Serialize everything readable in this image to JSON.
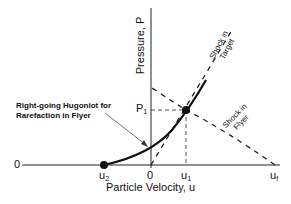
{
  "diagram": {
    "title": "",
    "axes": {
      "x_label": "Particle Velocity, u",
      "y_label": "Pressure, P",
      "x_origin_label": "0",
      "left_zero_label": "0"
    },
    "ticks": {
      "u2": {
        "base": "u",
        "sub": "2"
      },
      "u1": {
        "base": "u",
        "sub": "1"
      },
      "uf": {
        "base": "u",
        "sub": "f"
      },
      "p1": {
        "base": "P",
        "sub": "1"
      }
    },
    "annotations": {
      "hugoniot_line1": "Right-going Hugoniot for",
      "hugoniot_line2": "Rarefaction in Flyer",
      "shock_target_line1": "Shock in",
      "shock_target_line2": "Target",
      "shock_flyer_line1": "Shock in",
      "shock_flyer_line2": "Flyer"
    },
    "curves": [
      {
        "name": "Right-going Hugoniot for Rarefaction in Flyer",
        "style": "solid"
      },
      {
        "name": "Shock in Target",
        "style": "dashed"
      },
      {
        "name": "Shock in Flyer",
        "style": "dashed"
      },
      {
        "name": "P1 level",
        "style": "dashed"
      },
      {
        "name": "u1 level",
        "style": "dashed"
      }
    ],
    "points": [
      {
        "name": "u2",
        "on": "u-axis"
      },
      {
        "name": "intersection",
        "at": "(u1, P1)"
      }
    ],
    "colors": {
      "ink": "#111111",
      "background": "#ffffff"
    }
  }
}
